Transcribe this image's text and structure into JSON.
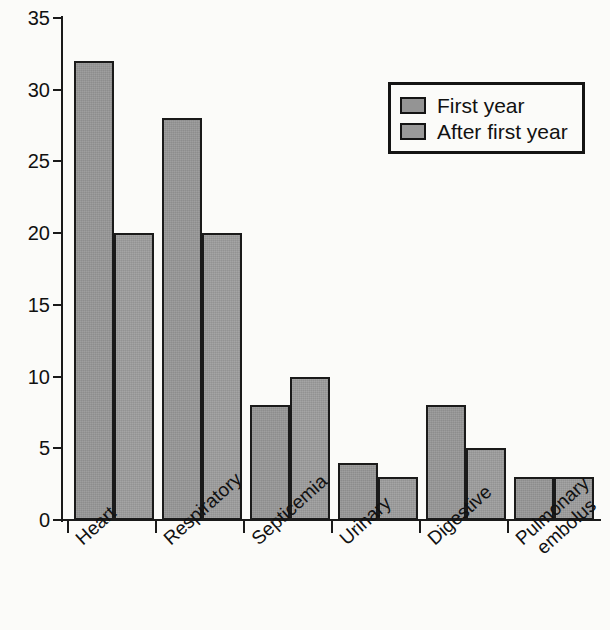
{
  "chart_data": {
    "type": "bar",
    "title": "",
    "subtitle": "",
    "xlabel": "",
    "ylabel": "",
    "ylim": [
      0,
      35
    ],
    "yticks": [
      0,
      5,
      10,
      15,
      20,
      25,
      30,
      35
    ],
    "ytick_labels": [
      "0",
      "5",
      "10",
      "15",
      "20",
      "25",
      "30",
      "35"
    ],
    "grid": false,
    "legend_position": "upper right",
    "categories": [
      "Heart",
      "Respiratory",
      "Septicemia",
      "Urinary",
      "Digestive",
      "Pulmonary embolus"
    ],
    "category_label_lines": [
      [
        "Heart"
      ],
      [
        "Respiratory"
      ],
      [
        "Septicemia"
      ],
      [
        "Urinary"
      ],
      [
        "Digestive"
      ],
      [
        "Pulmonary",
        "embolus"
      ]
    ],
    "series": [
      {
        "name": "First year",
        "color": "#949494",
        "values": [
          32,
          28,
          8,
          4,
          8,
          3
        ]
      },
      {
        "name": "After first year",
        "color": "#9a9a9a",
        "values": [
          20,
          20,
          10,
          3,
          5,
          3
        ]
      }
    ]
  },
  "legend": {
    "entries": [
      {
        "label": "First year"
      },
      {
        "label": "After first year"
      }
    ]
  },
  "colors": {
    "bar_fill_first": "#949494",
    "bar_fill_after": "#9a9a9a",
    "outline": "#1a1a1a",
    "background": "#fbfbf9",
    "text": "#111111"
  }
}
